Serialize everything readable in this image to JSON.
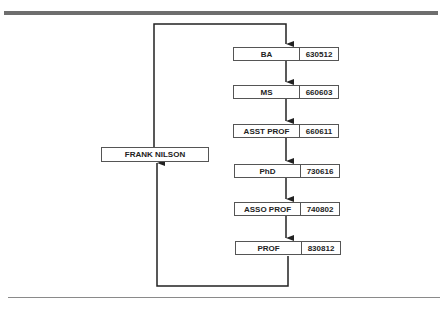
{
  "diagram": {
    "type": "flow",
    "person": "FRANK NILSON",
    "steps": [
      {
        "label": "BA",
        "code": "630512"
      },
      {
        "label": "MS",
        "code": "660603"
      },
      {
        "label": "ASST PROF",
        "code": "660611"
      },
      {
        "label": "PhD",
        "code": "730616"
      },
      {
        "label": "ASSO PROF",
        "code": "740802"
      },
      {
        "label": "PROF",
        "code": "830812"
      }
    ]
  }
}
